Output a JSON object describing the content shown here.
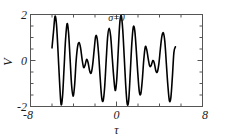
{
  "figure": {
    "background": "#ffffff",
    "frame_color": "#555555",
    "curve_color": "#000000",
    "annotation": "σ=0",
    "annotation_x": 0.0,
    "annotation_y": 1.72
  },
  "chart_data": {
    "type": "line",
    "title": "",
    "subtitle": "",
    "xlabel": "τ",
    "ylabel": "V",
    "xlim": [
      -8,
      8
    ],
    "ylim": [
      -2,
      2
    ],
    "xticks": [
      -8,
      0,
      8
    ],
    "xticklabels": [
      "-8",
      "0",
      "8"
    ],
    "yticks": [
      -2,
      0,
      2
    ],
    "yticklabels": [
      "-2",
      "0",
      "2"
    ],
    "x_minor_ticks": [
      -6,
      -4,
      -2,
      2,
      4,
      6
    ],
    "y_minor_ticks": [
      -1.5,
      -1,
      -0.5,
      0.5,
      1,
      1.5
    ],
    "grid": false,
    "legend": null,
    "annotations": [
      {
        "text": "σ=0",
        "x": 0.0,
        "y": 1.72
      }
    ],
    "series": [
      {
        "name": "V(τ)",
        "color": "#000000",
        "linewidth": 1.6,
        "x": [
          -6.0,
          -5.86,
          -5.72,
          -5.58,
          -5.44,
          -5.3,
          -5.16,
          -5.02,
          -4.88,
          -4.74,
          -4.6,
          -4.46,
          -4.32,
          -4.18,
          -4.04,
          -3.9,
          -3.76,
          -3.62,
          -3.48,
          -3.34,
          -3.2,
          -3.06,
          -2.92,
          -2.78,
          -2.64,
          -2.5,
          -2.36,
          -2.22,
          -2.08,
          -1.94,
          -1.8,
          -1.66,
          -1.52,
          -1.38,
          -1.24,
          -1.1,
          -0.96,
          -0.82,
          -0.68,
          -0.54,
          -0.4,
          -0.26,
          -0.12,
          0.02,
          0.16,
          0.3,
          0.44,
          0.58,
          0.72,
          0.86,
          1.0,
          1.14,
          1.28,
          1.42,
          1.56,
          1.7,
          1.84,
          1.98,
          2.12,
          2.26,
          2.4,
          2.54,
          2.68,
          2.82,
          2.96,
          3.1,
          3.24,
          3.38,
          3.52,
          3.66,
          3.8,
          3.94,
          4.08,
          4.22,
          4.36,
          4.5,
          4.64,
          4.78,
          4.92,
          5.06,
          5.2,
          5.34,
          5.48
        ],
        "y": [
          0.55,
          1.25,
          1.92,
          1.55,
          0.4,
          -0.9,
          -1.9,
          -1.55,
          -0.35,
          0.9,
          1.6,
          1.2,
          0.1,
          -1.05,
          -1.55,
          -1.1,
          -0.05,
          0.6,
          0.78,
          0.55,
          0.05,
          -0.3,
          -0.2,
          0.05,
          -0.1,
          -0.45,
          -0.55,
          -0.2,
          0.45,
          1.05,
          0.95,
          0.25,
          -0.75,
          -1.6,
          -1.75,
          -1.15,
          0.0,
          1.05,
          1.4,
          1.05,
          0.15,
          -0.7,
          -1.3,
          -0.85,
          0.4,
          1.6,
          1.95,
          1.35,
          0.15,
          -1.1,
          -1.9,
          -1.7,
          -0.55,
          0.7,
          1.45,
          1.3,
          0.45,
          -0.55,
          -1.35,
          -1.45,
          -0.85,
          0.05,
          0.6,
          0.45,
          0.05,
          -0.25,
          -0.2,
          0.0,
          -0.12,
          -0.45,
          -0.5,
          -0.15,
          0.5,
          1.05,
          1.2,
          0.8,
          -0.15,
          -1.1,
          -1.75,
          -1.6,
          -0.7,
          0.35,
          0.6
        ]
      }
    ]
  }
}
